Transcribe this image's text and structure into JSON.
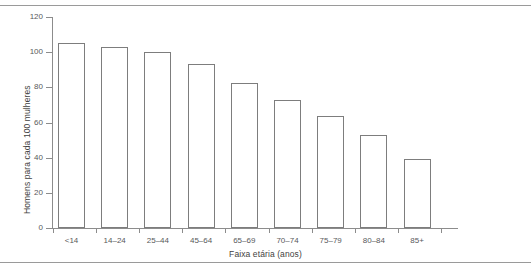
{
  "chart_data": {
    "type": "bar",
    "title": "",
    "subtitle": "",
    "xlabel": "Faixa etária (anos)",
    "ylabel": "Homens para cada 100 mulheres",
    "categories": [
      "<14",
      "14–24",
      "25–44",
      "45–64",
      "65–69",
      "70–74",
      "75–79",
      "80–84",
      "85+"
    ],
    "values": [
      105,
      103,
      100,
      93,
      82.5,
      73,
      63.5,
      53,
      39
    ],
    "series": [
      {
        "name": "Homens para cada 100 mulheres",
        "values": [
          105,
          103,
          100,
          93,
          82.5,
          73,
          63.5,
          53,
          39
        ]
      }
    ],
    "ylim": [
      0,
      120
    ],
    "yticks": [
      0,
      20,
      40,
      60,
      80,
      100,
      120
    ],
    "ytick_labels": [
      "0",
      "20",
      "40",
      "60",
      "80",
      "100",
      "120"
    ],
    "grid": false,
    "legend": false,
    "legend_position": "none",
    "bar_fill_color": "#ffffff",
    "bar_edge_color": "#7d7d7d",
    "axis_color": "#8c8c8c",
    "text_color": "#58595b"
  }
}
